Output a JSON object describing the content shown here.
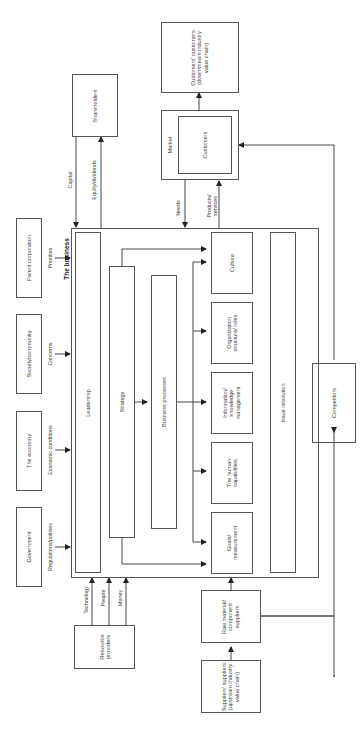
{
  "title": "The business",
  "nodes": {
    "government": "Government",
    "economy": "The economy",
    "society": "Society/community",
    "parent": "Parent corporation",
    "shareholders": "Shareholders",
    "market": "Market",
    "customers": "Customers",
    "customers_customers": "Customers' customers (downstream industry value chain)",
    "leadership": "Leadership",
    "strategy": "Strategy",
    "business_processes": "Business processes",
    "goals": "Goals/ measurement",
    "human": "The human capabilities",
    "information": "Information/ knowledge management",
    "organization": "Organization structure/ roles",
    "culture": "Culture",
    "issue_resolution": "Issue resolution",
    "competitors": "Competitors",
    "resource_providers": "Resource providers",
    "raw_material": "Raw material/ component suppliers",
    "suppliers_suppliers": "Suppliers' suppliers (upstream industry value chain)"
  },
  "edges": {
    "regulations": "Regulations/policies",
    "economic": "Economic conditions",
    "concerns": "Concerns",
    "priorities": "Priorities",
    "capital": "Capital",
    "equity": "Equity/dividends",
    "needs": "Needs",
    "products": "Products/ services",
    "technology": "Technology",
    "people": "People",
    "money": "Money"
  }
}
